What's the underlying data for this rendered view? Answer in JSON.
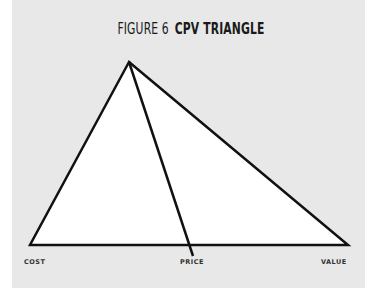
{
  "title": {
    "prefix": "FIGURE 6",
    "name": "CPV TRIANGLE"
  },
  "diagram": {
    "labels": {
      "cost": "COST",
      "price": "PRICE",
      "value": "VALUE"
    },
    "colors": {
      "panel": "#e8e8e8",
      "triangle_fill": "#ffffff",
      "stroke": "#111111"
    }
  }
}
